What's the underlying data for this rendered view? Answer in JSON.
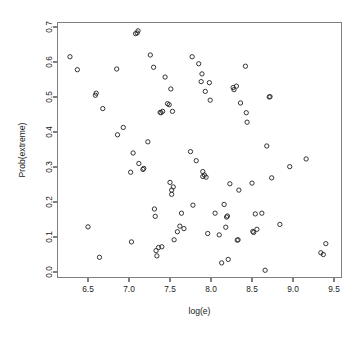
{
  "chart_data": {
    "type": "scatter",
    "title": "",
    "xlabel": "log(e)",
    "ylabel": "Prob(extreme)",
    "xlim": [
      6.22,
      9.53
    ],
    "ylim": [
      -0.012,
      0.712
    ],
    "xticks": [
      6.5,
      7.0,
      7.5,
      8.0,
      8.5,
      9.0,
      9.5
    ],
    "xtick_labels": [
      "6.5",
      "7.0",
      "7.5",
      "8.0",
      "8.5",
      "9.0",
      "9.5"
    ],
    "yticks": [
      0.0,
      0.1,
      0.2,
      0.3,
      0.4,
      0.5,
      0.6,
      0.7
    ],
    "ytick_labels": [
      "0.0",
      "0.1",
      "0.2",
      "0.3",
      "0.4",
      "0.5",
      "0.6",
      "0.7"
    ],
    "grid": false,
    "legend": null,
    "marker": "open-circle",
    "marker_color": "#2b2b2b",
    "point_count": 103,
    "points": [
      [
        6.28,
        0.615
      ],
      [
        6.37,
        0.578
      ],
      [
        6.5,
        0.129
      ],
      [
        6.59,
        0.505
      ],
      [
        6.6,
        0.511
      ],
      [
        6.64,
        0.042
      ],
      [
        6.68,
        0.467
      ],
      [
        6.85,
        0.58
      ],
      [
        6.86,
        0.392
      ],
      [
        6.93,
        0.413
      ],
      [
        7.02,
        0.285
      ],
      [
        7.03,
        0.086
      ],
      [
        7.05,
        0.34
      ],
      [
        7.08,
        0.681
      ],
      [
        7.1,
        0.683
      ],
      [
        7.11,
        0.689
      ],
      [
        7.12,
        0.31
      ],
      [
        7.17,
        0.293
      ],
      [
        7.18,
        0.296
      ],
      [
        7.23,
        0.372
      ],
      [
        7.26,
        0.62
      ],
      [
        7.3,
        0.585
      ],
      [
        7.31,
        0.18
      ],
      [
        7.32,
        0.159
      ],
      [
        7.33,
        0.061
      ],
      [
        7.34,
        0.046
      ],
      [
        7.36,
        0.07
      ],
      [
        7.38,
        0.456
      ],
      [
        7.39,
        0.455
      ],
      [
        7.4,
        0.072
      ],
      [
        7.41,
        0.459
      ],
      [
        7.44,
        0.557
      ],
      [
        7.47,
        0.481
      ],
      [
        7.49,
        0.478
      ],
      [
        7.5,
        0.256
      ],
      [
        7.51,
        0.523
      ],
      [
        7.52,
        0.222
      ],
      [
        7.52,
        0.234
      ],
      [
        7.53,
        0.459
      ],
      [
        7.54,
        0.243
      ],
      [
        7.55,
        0.092
      ],
      [
        7.59,
        0.115
      ],
      [
        7.62,
        0.131
      ],
      [
        7.64,
        0.168
      ],
      [
        7.67,
        0.124
      ],
      [
        7.75,
        0.344
      ],
      [
        7.77,
        0.615
      ],
      [
        7.78,
        0.191
      ],
      [
        7.82,
        0.318
      ],
      [
        7.85,
        0.595
      ],
      [
        7.88,
        0.544
      ],
      [
        7.89,
        0.566
      ],
      [
        7.9,
        0.273
      ],
      [
        7.9,
        0.287
      ],
      [
        7.92,
        0.277
      ],
      [
        7.93,
        0.516
      ],
      [
        7.94,
        0.271
      ],
      [
        7.96,
        0.11
      ],
      [
        7.98,
        0.541
      ],
      [
        7.99,
        0.491
      ],
      [
        8.05,
        0.168
      ],
      [
        8.1,
        0.106
      ],
      [
        8.13,
        0.026
      ],
      [
        8.16,
        0.193
      ],
      [
        8.18,
        0.128
      ],
      [
        8.19,
        0.157
      ],
      [
        8.2,
        0.16
      ],
      [
        8.21,
        0.036
      ],
      [
        8.23,
        0.252
      ],
      [
        8.27,
        0.527
      ],
      [
        8.28,
        0.521
      ],
      [
        8.31,
        0.531
      ],
      [
        8.32,
        0.091
      ],
      [
        8.33,
        0.092
      ],
      [
        8.34,
        0.234
      ],
      [
        8.36,
        0.483
      ],
      [
        8.42,
        0.588
      ],
      [
        8.43,
        0.455
      ],
      [
        8.44,
        0.428
      ],
      [
        8.5,
        0.254
      ],
      [
        8.51,
        0.116
      ],
      [
        8.52,
        0.113
      ],
      [
        8.54,
        0.166
      ],
      [
        8.56,
        0.122
      ],
      [
        8.62,
        0.168
      ],
      [
        8.66,
        0.005
      ],
      [
        8.68,
        0.36
      ],
      [
        8.71,
        0.5
      ],
      [
        8.72,
        0.501
      ],
      [
        8.74,
        0.269
      ],
      [
        8.84,
        0.136
      ],
      [
        8.96,
        0.301
      ],
      [
        9.16,
        0.323
      ],
      [
        9.34,
        0.055
      ],
      [
        9.37,
        0.05
      ],
      [
        9.4,
        0.081
      ]
    ]
  }
}
